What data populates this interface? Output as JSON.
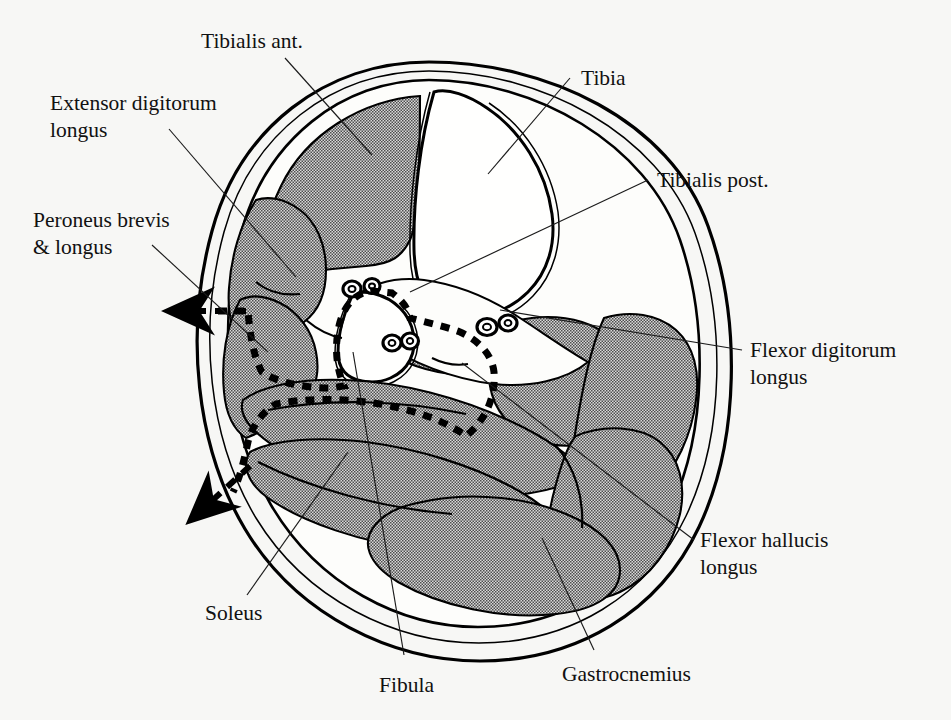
{
  "figure": {
    "type": "anatomical-cross-section",
    "region": "Leg (lower limb) transverse section, mid-calf",
    "background_color": "#f7f7f5",
    "ink_color": "#111111",
    "muscle_fill_description": "grey halftone stipple",
    "bone_fill_description": "white with trabecular speckle"
  },
  "labels": {
    "tibialis_ant": "Tibialis ant.",
    "extensor_digitorum_longus": "Extensor digitorum\nlongus",
    "extensor_digitorum_longus_line1": "Extensor digitorum",
    "extensor_digitorum_longus_line2": "longus",
    "peroneus": "Peroneus brevis\n& longus",
    "peroneus_line1": "Peroneus brevis",
    "peroneus_line2": "& longus",
    "soleus": "Soleus",
    "fibula": "Fibula",
    "gastrocnemius": "Gastrocnemius",
    "tibia": "Tibia",
    "tibialis_post": "Tibialis post.",
    "flexor_digitorum_longus_line1": "Flexor digitorum",
    "flexor_digitorum_longus_line2": "longus",
    "flexor_hallucis_longus_line1": "Flexor hallucis",
    "flexor_hallucis_longus_line2": "longus"
  },
  "structures": [
    {
      "name": "Tibialis ant.",
      "kind": "muscle",
      "side": "anterior-lateral"
    },
    {
      "name": "Extensor digitorum longus",
      "kind": "muscle",
      "side": "anterior-lateral"
    },
    {
      "name": "Peroneus brevis & longus",
      "kind": "muscle",
      "side": "lateral"
    },
    {
      "name": "Tibia",
      "kind": "bone",
      "side": "anterior-medial"
    },
    {
      "name": "Fibula",
      "kind": "bone",
      "side": "lateral"
    },
    {
      "name": "Tibialis post.",
      "kind": "muscle",
      "side": "deep-posterior"
    },
    {
      "name": "Flexor digitorum longus",
      "kind": "muscle",
      "side": "deep-posterior-medial"
    },
    {
      "name": "Flexor hallucis longus",
      "kind": "muscle",
      "side": "deep-posterior-lateral"
    },
    {
      "name": "Soleus",
      "kind": "muscle",
      "side": "superficial-posterior"
    },
    {
      "name": "Gastrocnemius",
      "kind": "muscle",
      "side": "superficial-posterior"
    }
  ],
  "annotations": {
    "arrow_upper": "arrow pointing left from dashed compartment boundary",
    "arrow_lower": "arrow pointing lower-left from dashed compartment boundary",
    "dashed_boundary": "heavy dashed line marking fascial compartment outline"
  }
}
